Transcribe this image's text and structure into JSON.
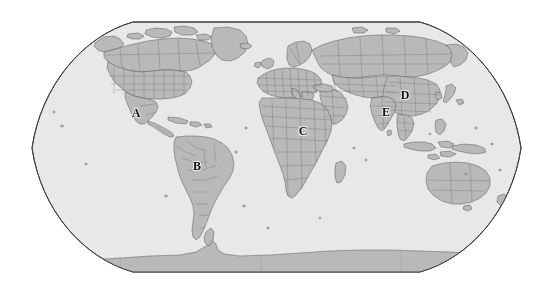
{
  "figure": {
    "type": "world-map",
    "projection": "robinson",
    "title": "",
    "background_color": "#ffffff",
    "width": 552,
    "height": 294
  },
  "map": {
    "ocean_color": "#e8e8e8",
    "land_color": "#b9b9b9",
    "border_color": "#4a4a4a",
    "outline_color": "#3f3f3f",
    "graticule": "none",
    "bounds": {
      "left": 28,
      "right": 524,
      "top": 22,
      "bottom": 273
    }
  },
  "labels": [
    {
      "id": "A",
      "text": "A",
      "region": "mexico",
      "x": 136,
      "y": 113
    },
    {
      "id": "B",
      "text": "B",
      "region": "brazil",
      "x": 197,
      "y": 166
    },
    {
      "id": "C",
      "text": "C",
      "region": "central-africa",
      "x": 303,
      "y": 131
    },
    {
      "id": "D",
      "text": "D",
      "region": "china",
      "x": 405,
      "y": 95
    },
    {
      "id": "E",
      "text": "E",
      "region": "india",
      "x": 386,
      "y": 112
    }
  ]
}
